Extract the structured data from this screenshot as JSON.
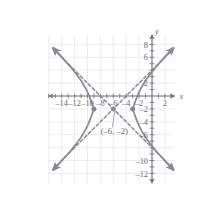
{
  "figure": {
    "name": "hyperbola-graph",
    "background": "#ffffff",
    "curve_color": "#8d8795",
    "axis_color": "#75717a",
    "grid_color": "#e8e6ec",
    "label_color": "#6d6a70"
  },
  "axes": {
    "x_axis_label": "x",
    "y_axis_label": "y",
    "x_tick_labels": [
      "–14",
      "–12",
      "–10",
      "–8",
      "–6",
      "–4",
      "–2",
      "2"
    ],
    "x_tick_values": [
      -14,
      -12,
      -10,
      -8,
      -6,
      -4,
      -2,
      2
    ],
    "y_tick_labels": [
      "8",
      "6",
      "2",
      "–2",
      "–4",
      "–6",
      "–10",
      "–12"
    ],
    "y_tick_values": [
      8,
      6,
      2,
      -2,
      -4,
      -6,
      -10,
      -12
    ],
    "x_range": [
      -16,
      3.5
    ],
    "y_range": [
      -13.5,
      9.5
    ],
    "grid": true,
    "grid_step": 2,
    "tick_step": 1
  },
  "annotations": {
    "center_label": "(–6, –2)"
  },
  "chart_data": {
    "type": "line",
    "title": "",
    "xlabel": "x",
    "ylabel": "y",
    "xlim": [
      -16,
      3.5
    ],
    "ylim": [
      -13.5,
      9.5
    ],
    "grid": true,
    "legend": "none",
    "conic": {
      "kind": "hyperbola",
      "orientation": "horizontal",
      "center": [
        -6,
        -2
      ],
      "a": 3,
      "b": 3,
      "vertices": [
        [
          -9,
          -2
        ],
        [
          -3,
          -2
        ]
      ],
      "asymptote_slopes": [
        1,
        -1
      ]
    },
    "points": [
      {
        "name": "vertex-left",
        "x": -9,
        "y": -2,
        "marker": "filled-circle"
      },
      {
        "name": "center",
        "x": -6,
        "y": -2,
        "marker": "filled-circle"
      },
      {
        "name": "vertex-right",
        "x": -3,
        "y": -2,
        "marker": "filled-circle"
      }
    ],
    "series": [
      {
        "name": "left-branch",
        "style": "solid",
        "x": [
          -15.3,
          -14.5,
          -13.6,
          -12.7,
          -11.8,
          -11.0,
          -10.4,
          -9.9,
          -9.5,
          -9.25,
          -9.1,
          -9.0,
          -9.1,
          -9.25,
          -9.5,
          -9.9,
          -10.4,
          -11.0,
          -11.8,
          -12.7,
          -13.6,
          -14.5,
          -15.3
        ],
        "y": [
          7.5,
          6.6,
          5.6,
          4.6,
          3.5,
          2.4,
          1.4,
          0.4,
          -0.6,
          -1.3,
          -1.8,
          -2.0,
          -2.2,
          -2.7,
          -3.4,
          -4.4,
          -5.4,
          -6.4,
          -7.5,
          -8.6,
          -9.6,
          -10.6,
          -11.5
        ]
      },
      {
        "name": "right-branch",
        "style": "solid",
        "x": [
          3.3,
          2.5,
          1.6,
          0.7,
          -0.2,
          -1.0,
          -1.6,
          -2.1,
          -2.5,
          -2.75,
          -2.9,
          -3.0,
          -2.9,
          -2.75,
          -2.5,
          -2.1,
          -1.6,
          -1.0,
          -0.2,
          0.7,
          1.6,
          2.5,
          3.3
        ],
        "y": [
          7.5,
          6.6,
          5.6,
          4.6,
          3.5,
          2.4,
          1.4,
          0.4,
          -0.6,
          -1.3,
          -1.8,
          -2.0,
          -2.2,
          -2.7,
          -3.4,
          -4.4,
          -5.4,
          -6.4,
          -7.5,
          -8.6,
          -9.6,
          -10.6,
          -11.5
        ]
      },
      {
        "name": "asymptote-positive-slope",
        "style": "dashed",
        "x": [
          -15.4,
          3.4
        ],
        "y": [
          -11.4,
          7.4
        ]
      },
      {
        "name": "asymptote-negative-slope",
        "style": "dashed",
        "x": [
          -15.4,
          3.4
        ],
        "y": [
          7.4,
          -11.4
        ]
      }
    ]
  }
}
